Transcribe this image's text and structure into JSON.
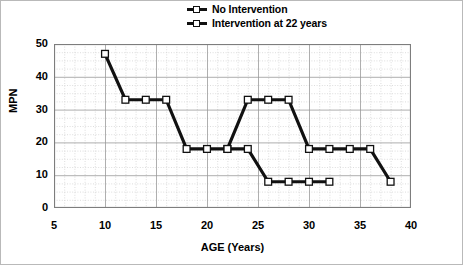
{
  "chart_data": {
    "type": "line",
    "title": "",
    "xlabel": "AGE (Years)",
    "ylabel": "MPN",
    "xlim": [
      5,
      40
    ],
    "ylim": [
      0,
      50
    ],
    "xticks": [
      5,
      10,
      15,
      20,
      25,
      30,
      35,
      40
    ],
    "yticks": [
      0,
      10,
      20,
      30,
      40,
      50
    ],
    "x_minor_step": 1,
    "y_minor_step": 2.5,
    "grid": true,
    "legend_position": "top-center",
    "marker": "open-square",
    "line_color": "#111111",
    "marker_face_color": "#ffffff",
    "series": [
      {
        "name": "No Intervention",
        "x": [
          10,
          12,
          14,
          16,
          18,
          20,
          22,
          24,
          26,
          28,
          30,
          32,
          34,
          36,
          38
        ],
        "values": [
          47,
          33,
          33,
          33,
          18,
          18,
          18,
          33,
          33,
          33,
          18,
          18,
          18,
          18,
          8
        ]
      },
      {
        "name": "Intervention at 22 years",
        "x": [
          22,
          24,
          26,
          28,
          30,
          32
        ],
        "values": [
          18,
          18,
          8,
          8,
          8,
          8
        ]
      }
    ]
  },
  "legend": {
    "items": [
      {
        "label": "No Intervention"
      },
      {
        "label": "Intervention at 22 years"
      }
    ]
  },
  "axes": {
    "y_title": "MPN",
    "x_title": "AGE (Years)",
    "y_tick_labels": [
      "50",
      "40",
      "30",
      "20",
      "10",
      "0"
    ],
    "x_tick_labels": [
      "5",
      "10",
      "15",
      "20",
      "25",
      "30",
      "35",
      "40"
    ]
  }
}
